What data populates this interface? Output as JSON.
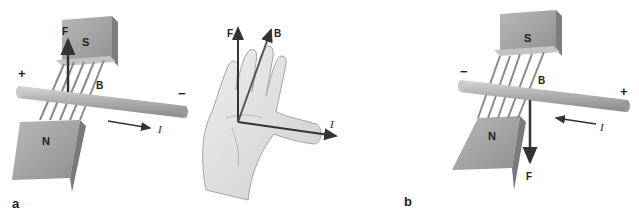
{
  "panels": [
    {
      "id": "a",
      "label": "a",
      "magnet_top": "S",
      "magnet_bottom": "N",
      "force_label": "F",
      "field_label": "B",
      "current_label": "I",
      "left_terminal": "+",
      "right_terminal": "−",
      "force_direction": "up",
      "current_direction": "right"
    },
    {
      "id": "hand",
      "force_label": "F",
      "field_label": "B",
      "current_label": "I"
    },
    {
      "id": "b",
      "label": "b",
      "magnet_top": "S",
      "magnet_bottom": "N",
      "force_label": "F",
      "field_label": "B",
      "current_label": "I",
      "left_terminal": "−",
      "right_terminal": "+",
      "force_direction": "down",
      "current_direction": "left"
    }
  ],
  "colors": {
    "magnet_face": "#a9a9a9",
    "magnet_side": "#8c8c8c",
    "rod": "#b5b5b5",
    "arrow": "#333333",
    "hand": "#e2e2e2"
  }
}
